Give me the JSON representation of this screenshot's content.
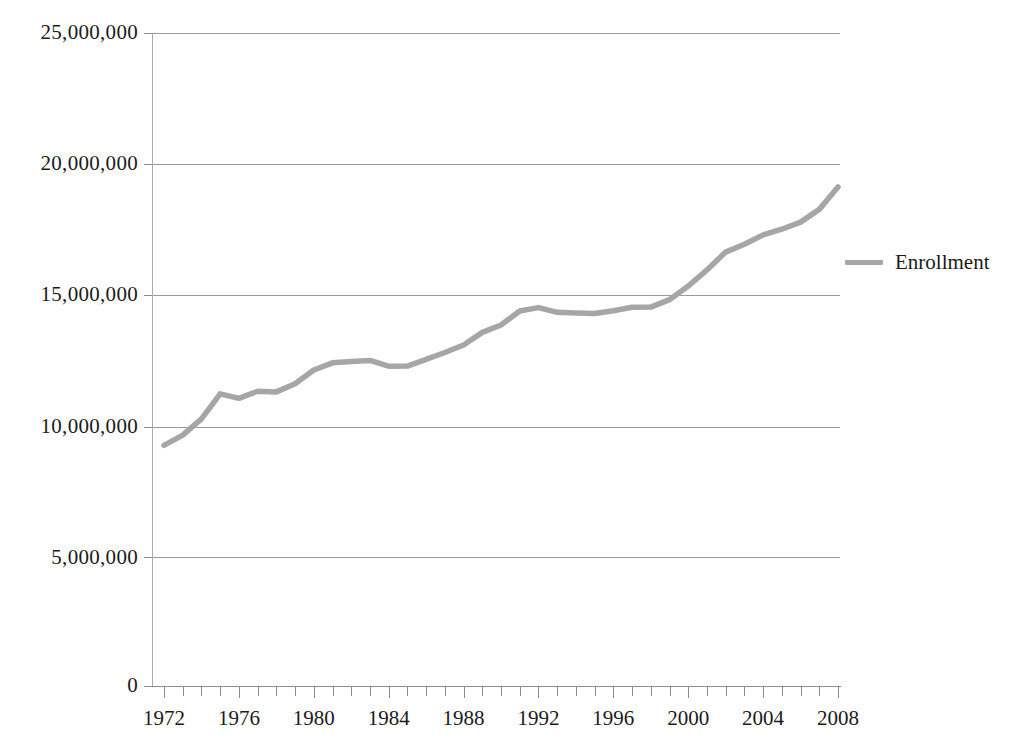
{
  "chart_data": {
    "type": "line",
    "title": "",
    "subtitle": "",
    "xlabel": "",
    "ylabel": "",
    "xlim": [
      1972,
      2008
    ],
    "ylim": [
      0,
      25000000
    ],
    "grid": true,
    "legend_position": "right",
    "y_ticks": [
      {
        "value": 25000000,
        "label": "25,000,000"
      },
      {
        "value": 20000000,
        "label": "20,000,000"
      },
      {
        "value": 15000000,
        "label": "15,000,000"
      },
      {
        "value": 10000000,
        "label": "10,000,000"
      },
      {
        "value": 5000000,
        "label": "5,000,000"
      },
      {
        "value": 0,
        "label": "0"
      }
    ],
    "x_tick_labels": [
      "1972",
      "1976",
      "1980",
      "1984",
      "1988",
      "1992",
      "1996",
      "2000",
      "2004",
      "2008"
    ],
    "x_tick_values": [
      1972,
      1976,
      1980,
      1984,
      1988,
      1992,
      1996,
      2000,
      2004,
      2008
    ],
    "x_minor_tick_interval": 1,
    "series": [
      {
        "name": "Enrollment",
        "color": "#a6a6a6",
        "x": [
          1972,
          1973,
          1974,
          1975,
          1976,
          1977,
          1978,
          1979,
          1980,
          1981,
          1982,
          1983,
          1984,
          1985,
          1986,
          1987,
          1988,
          1989,
          1990,
          1991,
          1992,
          1993,
          1994,
          1995,
          1996,
          1997,
          1998,
          1999,
          2000,
          2001,
          2002,
          2003,
          2004,
          2005,
          2006,
          2007,
          2008
        ],
        "values": [
          9215000,
          9602000,
          10224000,
          11185000,
          11012000,
          11286000,
          11260000,
          11570000,
          12097000,
          12372000,
          12426000,
          12465000,
          12242000,
          12247000,
          12504000,
          12767000,
          13055000,
          13539000,
          13819000,
          14359000,
          14487000,
          14305000,
          14279000,
          14262000,
          14368000,
          14502000,
          14507000,
          14791000,
          15312000,
          15928000,
          16612000,
          16911000,
          17272000,
          17487000,
          17759000,
          18248000,
          19103000
        ]
      }
    ]
  },
  "legend": {
    "entries": [
      {
        "label": "Enrollment",
        "color": "#a6a6a6"
      }
    ]
  }
}
